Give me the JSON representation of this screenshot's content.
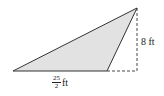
{
  "diagram": {
    "type": "triangle",
    "fill_color": "#e2e2e2",
    "stroke_color": "#333333",
    "vertices": {
      "left": [
        13,
        71
      ],
      "bottom_right": [
        107,
        71
      ],
      "apex": [
        137,
        8
      ]
    },
    "height_line": {
      "from": [
        137,
        8
      ],
      "to": [
        137,
        71
      ],
      "style": "dashed"
    },
    "base_extension": {
      "from": [
        107,
        71
      ],
      "to": [
        137,
        71
      ],
      "style": "dashed"
    },
    "labels": {
      "height": "8 ft",
      "base_numerator": "25",
      "base_denominator": "2",
      "base_unit": "ft"
    }
  }
}
